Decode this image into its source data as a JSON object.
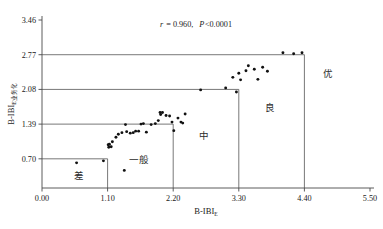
{
  "chart_data": {
    "type": "scatter",
    "title": "",
    "xlabel": "B-IBI",
    "xlabel_sub": "E",
    "ylabel": "B-IBI",
    "ylabel_sub": "E业务化",
    "xlim": [
      0.0,
      5.5
    ],
    "ylim": [
      0.0,
      3.46
    ],
    "xticks": [
      "0.00",
      "1.10",
      "2.20",
      "3.30",
      "4.40",
      "5.50"
    ],
    "xtick_values": [
      0.0,
      1.1,
      2.2,
      3.3,
      4.4,
      5.5
    ],
    "yticks": [
      "0.70",
      "1.39",
      "2.08",
      "2.77",
      "3.46"
    ],
    "ytick_values": [
      0.7,
      1.39,
      2.08,
      2.77,
      3.46
    ],
    "grid": false,
    "legend": "none",
    "annotation": "r = 0.960, P<0.0001",
    "annotation_r_symbol": "r",
    "annotation_r_value": "= 0.960,",
    "annotation_p_symbol": "P",
    "annotation_p_value": "<0.0001",
    "correlation_r": 0.96,
    "p_value": "<0.0001",
    "zone_boxes": [
      {
        "label": "差",
        "x_max": 1.1,
        "y_max": 0.7,
        "label_x": 0.62,
        "label_y": 0.3
      },
      {
        "label": "一般",
        "x_max": 2.2,
        "y_max": 1.39,
        "label_x": 1.62,
        "label_y": 0.62
      },
      {
        "label": "中",
        "x_max": 3.3,
        "y_max": 2.08,
        "label_x": 2.72,
        "label_y": 1.1
      },
      {
        "label": "良",
        "x_max": 4.4,
        "y_max": 2.77,
        "label_x": 3.82,
        "label_y": 1.66
      },
      {
        "label": "优",
        "x_max": 5.5,
        "y_max": 3.46,
        "label_x": 4.8,
        "label_y": 2.32
      }
    ],
    "points": [
      {
        "x": 0.58,
        "y": 0.62
      },
      {
        "x": 1.03,
        "y": 0.66
      },
      {
        "x": 1.38,
        "y": 0.47
      },
      {
        "x": 1.11,
        "y": 0.98
      },
      {
        "x": 1.13,
        "y": 0.99
      },
      {
        "x": 1.12,
        "y": 0.93
      },
      {
        "x": 1.16,
        "y": 0.94
      },
      {
        "x": 1.18,
        "y": 1.04
      },
      {
        "x": 1.24,
        "y": 1.13
      },
      {
        "x": 1.28,
        "y": 1.19
      },
      {
        "x": 1.34,
        "y": 1.22
      },
      {
        "x": 1.4,
        "y": 1.38
      },
      {
        "x": 1.42,
        "y": 1.24
      },
      {
        "x": 1.48,
        "y": 1.21
      },
      {
        "x": 1.53,
        "y": 1.22
      },
      {
        "x": 1.57,
        "y": 1.25
      },
      {
        "x": 1.62,
        "y": 1.25
      },
      {
        "x": 1.66,
        "y": 1.39
      },
      {
        "x": 1.7,
        "y": 1.4
      },
      {
        "x": 1.75,
        "y": 1.23
      },
      {
        "x": 1.83,
        "y": 1.38
      },
      {
        "x": 1.9,
        "y": 1.4
      },
      {
        "x": 1.95,
        "y": 1.46
      },
      {
        "x": 1.98,
        "y": 1.62
      },
      {
        "x": 1.99,
        "y": 1.58
      },
      {
        "x": 2.02,
        "y": 1.62
      },
      {
        "x": 2.08,
        "y": 1.56
      },
      {
        "x": 2.14,
        "y": 1.55
      },
      {
        "x": 2.18,
        "y": 1.43
      },
      {
        "x": 2.21,
        "y": 1.26
      },
      {
        "x": 2.28,
        "y": 1.51
      },
      {
        "x": 2.33,
        "y": 1.43
      },
      {
        "x": 2.36,
        "y": 1.41
      },
      {
        "x": 2.4,
        "y": 1.59
      },
      {
        "x": 2.66,
        "y": 2.07
      },
      {
        "x": 3.26,
        "y": 2.03
      },
      {
        "x": 3.08,
        "y": 2.11
      },
      {
        "x": 3.2,
        "y": 2.32
      },
      {
        "x": 3.3,
        "y": 2.4
      },
      {
        "x": 3.33,
        "y": 2.27
      },
      {
        "x": 3.42,
        "y": 2.45
      },
      {
        "x": 3.46,
        "y": 2.55
      },
      {
        "x": 3.56,
        "y": 2.48
      },
      {
        "x": 3.62,
        "y": 2.28
      },
      {
        "x": 3.7,
        "y": 2.52
      },
      {
        "x": 3.78,
        "y": 2.44
      },
      {
        "x": 4.04,
        "y": 2.81
      },
      {
        "x": 4.22,
        "y": 2.79
      },
      {
        "x": 4.36,
        "y": 2.81
      }
    ]
  }
}
